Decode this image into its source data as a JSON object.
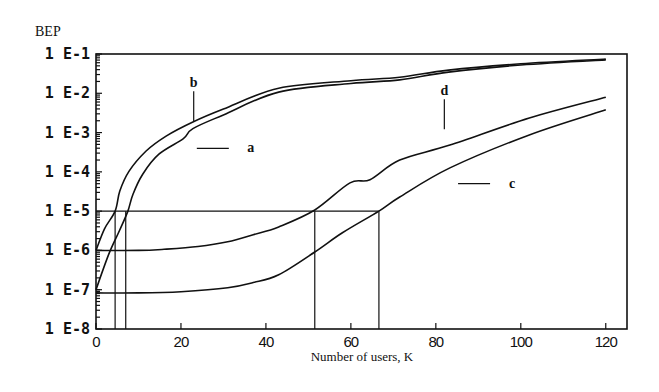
{
  "chart_data": {
    "type": "line",
    "title": "",
    "ylabel": "BEP",
    "xlabel": "Number of users, K",
    "yscale": "log",
    "ylim": [
      1e-08,
      0.1
    ],
    "xlim": [
      0,
      125
    ],
    "x_ticks": [
      0,
      20,
      40,
      60,
      80,
      100,
      120
    ],
    "x_tick_labels": [
      "0",
      "20",
      "40",
      "60",
      "80",
      "100",
      "120"
    ],
    "y_ticks": [
      0.1,
      0.01,
      0.001,
      0.0001,
      1e-05,
      1e-06,
      1e-07,
      1e-08
    ],
    "y_tick_labels": [
      "1 E-1",
      "1 E-2",
      "1 E-3",
      "1 E-4",
      "1 E-5",
      "1 E-6",
      "1 E-7",
      "1 E-8"
    ],
    "grid": false,
    "series": [
      {
        "name": "a",
        "x": [
          0,
          2,
          4.5,
          5.6,
          7.8,
          11.8,
          16.5,
          22.8,
          30,
          43,
          60,
          71.5,
          83,
          100,
          120
        ],
        "log10_y": [
          -6.0,
          -5.45,
          -5.0,
          -4.49,
          -3.98,
          -3.47,
          -3.09,
          -2.73,
          -2.4,
          -1.87,
          -1.68,
          -1.59,
          -1.41,
          -1.25,
          -1.13
        ]
      },
      {
        "name": "b",
        "x": [
          0,
          3,
          5.5,
          7.5,
          8.7,
          11,
          14.8,
          20.5,
          22.8,
          30,
          43,
          60,
          71.5,
          83,
          100,
          120
        ],
        "log10_y": [
          -7.0,
          -6.1,
          -5.5,
          -5.0,
          -4.57,
          -4.06,
          -3.55,
          -3.16,
          -2.9,
          -2.55,
          -1.97,
          -1.75,
          -1.66,
          -1.46,
          -1.28,
          -1.15
        ]
      },
      {
        "name": "d",
        "x": [
          0,
          10,
          16,
          24,
          31,
          37,
          43,
          51.5,
          59.8,
          64.5,
          71.5,
          83.3,
          102,
          120
        ],
        "log10_y": [
          -6.0,
          -6.0,
          -5.97,
          -5.9,
          -5.78,
          -5.6,
          -5.4,
          -4.97,
          -4.28,
          -4.2,
          -3.7,
          -3.32,
          -2.63,
          -2.1
        ]
      },
      {
        "name": "c",
        "x": [
          0,
          10,
          20,
          31,
          37,
          43,
          51.5,
          58,
          66.6,
          71.5,
          83.3,
          102,
          120
        ],
        "log10_y": [
          -7.08,
          -7.08,
          -7.05,
          -6.95,
          -6.82,
          -6.62,
          -6.04,
          -5.55,
          -5.0,
          -4.64,
          -3.9,
          -3.06,
          -2.42
        ]
      }
    ],
    "reference_lines": {
      "bep_threshold": 1e-05,
      "threshold_crossings_k": [
        4.5,
        7,
        51.5,
        66.6
      ],
      "baseline_levels": [
        1e-06,
        1e-07
      ]
    },
    "annotations": [
      {
        "label": "b",
        "points_to": "b",
        "x": 23,
        "log10_y": -2.0,
        "style": "vertical-tick"
      },
      {
        "label": "a",
        "points_to": "a",
        "x": 27.5,
        "log10_y": -3.4,
        "style": "horizontal-tick"
      },
      {
        "label": "d",
        "points_to": "d",
        "x": 82,
        "log10_y": -2.2,
        "style": "vertical-tick"
      },
      {
        "label": "c",
        "points_to": "c",
        "x": 89,
        "log10_y": -4.3,
        "style": "horizontal-tick"
      }
    ]
  }
}
